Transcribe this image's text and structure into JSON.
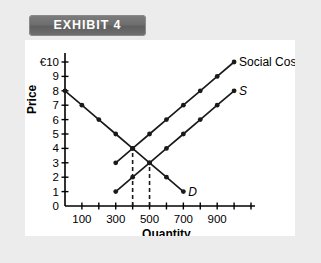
{
  "banner": {
    "label": "EXHIBIT 4"
  },
  "chart_data": {
    "type": "line",
    "title": "",
    "xlabel": "Quantity",
    "ylabel": "Price",
    "currency_symbol": "€",
    "y_top_label": "€10",
    "yticks": [
      0,
      1,
      2,
      3,
      4,
      5,
      6,
      7,
      8,
      9,
      10
    ],
    "ytick_labels": [
      "0",
      "1",
      "2",
      "3",
      "4",
      "5",
      "6",
      "7",
      "8",
      "9",
      "€10"
    ],
    "ylim": [
      0,
      10
    ],
    "xlim": [
      0,
      1100
    ],
    "xticks": [
      100,
      200,
      300,
      400,
      500,
      600,
      700,
      800,
      900,
      1000,
      1100
    ],
    "xtick_labels": [
      "100",
      "",
      "300",
      "",
      "500",
      "",
      "700",
      "",
      "900",
      "",
      ""
    ],
    "grid": false,
    "legend_position": "inline-right",
    "series": [
      {
        "name": "D",
        "label": "D",
        "label_style": "italic",
        "markers": true,
        "x": [
          0,
          100,
          200,
          300,
          400,
          500,
          600,
          700
        ],
        "y": [
          8,
          7,
          6,
          5,
          4,
          3,
          2,
          1
        ]
      },
      {
        "name": "S",
        "label": "S",
        "label_style": "italic",
        "markers": true,
        "x": [
          300,
          400,
          500,
          600,
          700,
          800,
          900,
          1000
        ],
        "y": [
          1,
          2,
          3,
          4,
          5,
          6,
          7,
          8
        ]
      },
      {
        "name": "Social Cost",
        "label": "Social Cost",
        "label_style": "normal",
        "markers": true,
        "x": [
          300,
          400,
          500,
          600,
          700,
          800,
          900,
          1000
        ],
        "y": [
          3,
          4,
          5,
          6,
          7,
          8,
          9,
          10
        ]
      }
    ],
    "annotations": [
      {
        "type": "vline-dashed",
        "x": 400,
        "y_from": 0,
        "y_to": 4,
        "note": "Social Cost intersects D at Q=400, P=4"
      },
      {
        "type": "vline-dashed",
        "x": 500,
        "y_from": 0,
        "y_to": 3,
        "note": "S intersects D at Q=500, P=3"
      }
    ]
  }
}
